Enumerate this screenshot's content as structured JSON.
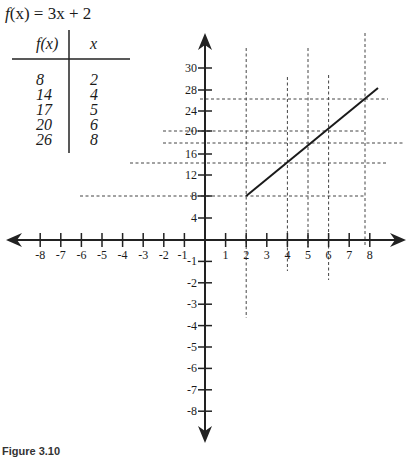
{
  "title": {
    "prefix": "f",
    "rest": "(x) = 3x + 2"
  },
  "table": {
    "headers": [
      "f(x)",
      "x"
    ],
    "rows": [
      {
        "fx": "8",
        "x": "2"
      },
      {
        "fx": "14",
        "x": "4"
      },
      {
        "fx": "17",
        "x": "5"
      },
      {
        "fx": "20",
        "x": "6"
      },
      {
        "fx": "26",
        "x": "8"
      }
    ]
  },
  "caption": "Figure 3.10",
  "chart_data": {
    "type": "line",
    "title": "f(x) = 3x + 2",
    "function": "3x + 2",
    "xlabel": "",
    "ylabel": "",
    "x_ticks": [
      -8,
      -7,
      -6,
      -5,
      -4,
      -3,
      -2,
      -1,
      1,
      2,
      3,
      4,
      5,
      6,
      7,
      8
    ],
    "y_ticks_positive": [
      4,
      8,
      12,
      16,
      20,
      24,
      28,
      30
    ],
    "y_ticks_negative": [
      -1,
      -2,
      -3,
      -4,
      -5,
      -6,
      -7,
      -8
    ],
    "xlim": [
      -9,
      9
    ],
    "series": [
      {
        "name": "f(x) = 3x + 2",
        "points": [
          {
            "x": 2,
            "y": 8
          },
          {
            "x": 8.4,
            "y": 28
          }
        ]
      }
    ],
    "points": [
      {
        "x": 2,
        "y": 8
      },
      {
        "x": 4,
        "y": 14
      },
      {
        "x": 5,
        "y": 17
      },
      {
        "x": 6,
        "y": 20
      },
      {
        "x": 8,
        "y": 26
      }
    ],
    "grid": "dashed guide lines through tabulated points"
  }
}
